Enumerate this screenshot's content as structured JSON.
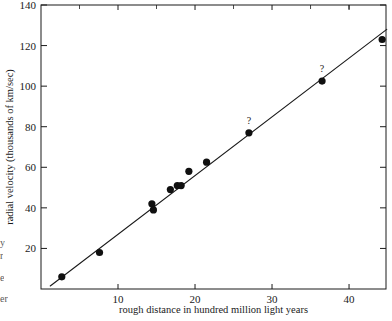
{
  "figure": {
    "background": "#ffffff",
    "ink_color": "#1a1a1a",
    "plot_frame": {
      "left_px": 41,
      "right_px": 386,
      "top_px": 5,
      "bottom_px": 289
    }
  },
  "chart_data": {
    "type": "scatter",
    "title": "",
    "xlabel": "rough distance in hundred million light years",
    "ylabel": "radial velocity (thousands of km/sec)",
    "xlim": [
      0,
      44.8
    ],
    "ylim": [
      0,
      140
    ],
    "xticks": [
      10,
      20,
      30,
      40
    ],
    "xtick_labels": [
      "10",
      "20",
      "30",
      "40"
    ],
    "yticks": [
      20,
      40,
      60,
      80,
      100,
      120,
      140
    ],
    "ytick_labels": [
      "20",
      "40",
      "60",
      "80",
      "100",
      "120",
      "140"
    ],
    "grid": false,
    "legend": null,
    "marker": "filled-circle",
    "marker_color": "#101010",
    "points": [
      {
        "x": 2.7,
        "y": 6,
        "annotation": ""
      },
      {
        "x": 7.6,
        "y": 18,
        "annotation": ""
      },
      {
        "x": 14.4,
        "y": 42,
        "annotation": ""
      },
      {
        "x": 14.6,
        "y": 39,
        "annotation": ""
      },
      {
        "x": 16.8,
        "y": 49,
        "annotation": ""
      },
      {
        "x": 17.7,
        "y": 51,
        "annotation": ""
      },
      {
        "x": 18.2,
        "y": 51,
        "annotation": ""
      },
      {
        "x": 19.2,
        "y": 58,
        "annotation": ""
      },
      {
        "x": 21.5,
        "y": 62.5,
        "annotation": ""
      },
      {
        "x": 27.0,
        "y": 77,
        "annotation": "?"
      },
      {
        "x": 36.5,
        "y": 102.5,
        "annotation": "?"
      },
      {
        "x": 44.3,
        "y": 123,
        "annotation": ""
      }
    ],
    "fit_line": {
      "label": "",
      "x_start": 1.2,
      "y_start": 1.5,
      "x_end": 44.9,
      "y_end": 128.0,
      "style": "solid"
    }
  },
  "margin_fragments": [
    {
      "text": "y",
      "top_px": 237
    },
    {
      "text": "r",
      "top_px": 250
    },
    {
      "text": "e",
      "top_px": 272
    },
    {
      "text": "er",
      "top_px": 293
    }
  ]
}
